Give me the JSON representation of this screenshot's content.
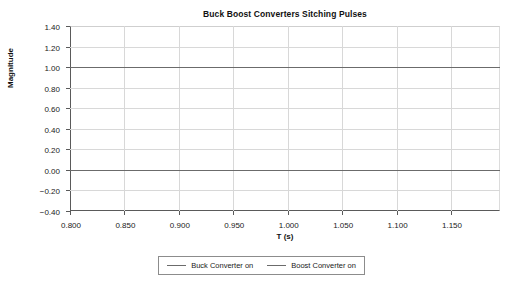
{
  "chart_data": {
    "type": "line",
    "title": "Buck Boost Converters Sitching Pulses",
    "xlabel": "T (s)",
    "ylabel": "Magnitude",
    "xlim": [
      0.8,
      1.195
    ],
    "ylim": [
      -0.4,
      1.4
    ],
    "grid": true,
    "legend_position": "bottom-center",
    "xticks": [
      0.8,
      0.85,
      0.9,
      0.95,
      1.0,
      1.05,
      1.1,
      1.15
    ],
    "xticklabels": [
      "0.800",
      "0.850",
      "0.900",
      "0.950",
      "1.000",
      "1.050",
      "1.100",
      "1.150"
    ],
    "yticks": [
      1.4,
      1.2,
      1.0,
      0.8,
      0.6,
      0.4,
      0.2,
      0.0,
      -0.2,
      -0.4
    ],
    "yticklabels": [
      "1.40",
      "1.20",
      "1.00",
      "0.80",
      "0.60",
      "0.40",
      "0.20",
      "0.00",
      "-0.20",
      "-0.40"
    ],
    "series": [
      {
        "name": "Buck Converter on",
        "color": "#6b6b6b",
        "constant_value": 1.0,
        "x": [
          0.8,
          1.195
        ],
        "values": [
          1.0,
          1.0
        ]
      },
      {
        "name": "Boost Converter on",
        "color": "#6b6b6b",
        "constant_value": 0.0,
        "x": [
          0.8,
          1.195
        ],
        "values": [
          0.0,
          0.0
        ]
      }
    ]
  },
  "legend": {
    "entries": [
      {
        "label": "Buck Converter on"
      },
      {
        "label": "Boost Converter on"
      }
    ]
  }
}
